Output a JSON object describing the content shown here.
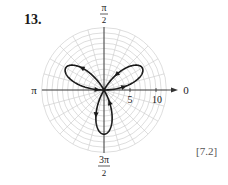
{
  "problem": {
    "number": "13.",
    "section_ref": "[7.2]"
  },
  "chart_data": {
    "type": "polar",
    "title": "",
    "curve": "three-petal rose (r = a·sin 3θ)",
    "amplitude": 8.5,
    "petal_angles_deg": [
      30,
      150,
      270
    ],
    "angle_labels": {
      "0": "0",
      "90": "π/2",
      "180": "π",
      "270": "3π/2"
    },
    "radial_tick_labels": [
      "5",
      "10"
    ],
    "radial_ticks": [
      5,
      10
    ],
    "grid": {
      "rings": 12,
      "ring_step": 1,
      "radial_step_deg": 15,
      "on": true
    },
    "direction_arrows": true,
    "colors": {
      "curve": "#1a1a1a",
      "grid": "#c8c8c8",
      "axis": "#333333"
    }
  },
  "labels": {
    "pi_over_2_num": "π",
    "pi_over_2_den": "2",
    "pi": "π",
    "zero": "0",
    "three_pi_over_2_num": "3π",
    "three_pi_over_2_den": "2",
    "tick5": "5",
    "tick10": "10"
  }
}
